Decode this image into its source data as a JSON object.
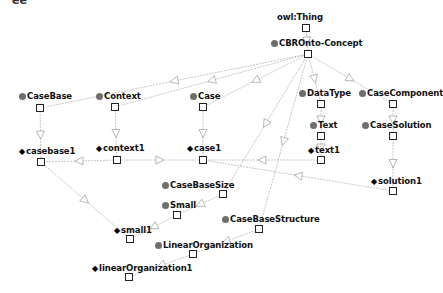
{
  "corner_fragment": "ee",
  "nodes": [
    {
      "id": "owlThing",
      "label": "owl:Thing",
      "kind": "root",
      "lx": 277,
      "ly": 12,
      "bx": 302,
      "by": 24
    },
    {
      "id": "cbro",
      "label": "CBROnto-Concept",
      "kind": "class",
      "lx": 271,
      "ly": 38,
      "bx": 304,
      "by": 50
    },
    {
      "id": "casebase",
      "label": "CaseBase",
      "kind": "class",
      "lx": 19,
      "ly": 91,
      "bx": 36,
      "by": 104
    },
    {
      "id": "context",
      "label": "Context",
      "kind": "class",
      "lx": 96,
      "ly": 91,
      "bx": 111,
      "by": 103
    },
    {
      "id": "case",
      "label": "Case",
      "kind": "class",
      "lx": 190,
      "ly": 91,
      "bx": 199,
      "by": 103
    },
    {
      "id": "datatype",
      "label": "DataType",
      "kind": "class",
      "lx": 299,
      "ly": 88,
      "bx": 317,
      "by": 100
    },
    {
      "id": "casecomponent",
      "label": "CaseComponent",
      "kind": "class",
      "lx": 359,
      "ly": 88,
      "bx": 389,
      "by": 100
    },
    {
      "id": "text",
      "label": "Text",
      "kind": "class",
      "lx": 310,
      "ly": 120,
      "bx": 317,
      "by": 132
    },
    {
      "id": "casesolution",
      "label": "CaseSolution",
      "kind": "class",
      "lx": 362,
      "ly": 120,
      "bx": 389,
      "by": 132
    },
    {
      "id": "casebase1",
      "label": "casebase1",
      "kind": "individual",
      "lx": 19,
      "ly": 146,
      "bx": 37,
      "by": 158
    },
    {
      "id": "context1",
      "label": "context1",
      "kind": "individual",
      "lx": 96,
      "ly": 143,
      "bx": 113,
      "by": 156
    },
    {
      "id": "case1",
      "label": "case1",
      "kind": "individual",
      "lx": 187,
      "ly": 143,
      "bx": 199,
      "by": 156
    },
    {
      "id": "text1",
      "label": "text1",
      "kind": "individual",
      "lx": 308,
      "ly": 145,
      "bx": 317,
      "by": 156
    },
    {
      "id": "solution1",
      "label": "solution1",
      "kind": "individual",
      "lx": 371,
      "ly": 176,
      "bx": 389,
      "by": 187
    },
    {
      "id": "casebasesize",
      "label": "CaseBaseSize",
      "kind": "class",
      "lx": 162,
      "ly": 180,
      "bx": 219,
      "by": 190
    },
    {
      "id": "small",
      "label": "Small",
      "kind": "class",
      "lx": 162,
      "ly": 200,
      "bx": 173,
      "by": 211
    },
    {
      "id": "small1",
      "label": "small1",
      "kind": "individual",
      "lx": 114,
      "ly": 225,
      "bx": 126,
      "by": 235
    },
    {
      "id": "casebasestructure",
      "label": "CaseBaseStructure",
      "kind": "class",
      "lx": 222,
      "ly": 214,
      "bx": 255,
      "by": 225
    },
    {
      "id": "linearorg",
      "label": "LinearOrganization",
      "kind": "class",
      "lx": 155,
      "ly": 240,
      "bx": 189,
      "by": 250
    },
    {
      "id": "linearorg1",
      "label": "linearOrganization1",
      "kind": "individual",
      "lx": 92,
      "ly": 263,
      "bx": 125,
      "by": 273
    }
  ],
  "edges": [
    {
      "from": "owlThing",
      "to": "cbro"
    },
    {
      "from": "cbro",
      "to": "casebase"
    },
    {
      "from": "cbro",
      "to": "context"
    },
    {
      "from": "cbro",
      "to": "case"
    },
    {
      "from": "cbro",
      "to": "datatype"
    },
    {
      "from": "cbro",
      "to": "casecomponent"
    },
    {
      "from": "cbro",
      "to": "casebasesize"
    },
    {
      "from": "cbro",
      "to": "casebasestructure"
    },
    {
      "from": "casebase",
      "to": "casebase1"
    },
    {
      "from": "context",
      "to": "context1"
    },
    {
      "from": "case",
      "to": "case1"
    },
    {
      "from": "datatype",
      "to": "text"
    },
    {
      "from": "text",
      "to": "text1"
    },
    {
      "from": "casecomponent",
      "to": "casesolution"
    },
    {
      "from": "casesolution",
      "to": "solution1"
    },
    {
      "from": "context1",
      "to": "casebase1"
    },
    {
      "from": "context1",
      "to": "case1"
    },
    {
      "from": "text1",
      "to": "case1"
    },
    {
      "from": "solution1",
      "to": "case1"
    },
    {
      "from": "casebase1",
      "to": "small1"
    },
    {
      "from": "casebasesize",
      "to": "small"
    },
    {
      "from": "small",
      "to": "small1"
    },
    {
      "from": "casebasestructure",
      "to": "linearorg"
    },
    {
      "from": "linearorg",
      "to": "linearorg1"
    }
  ],
  "colors": {
    "edge": "#b8b8b8",
    "class_dot": "#6e6e6e",
    "text": "#111111"
  }
}
